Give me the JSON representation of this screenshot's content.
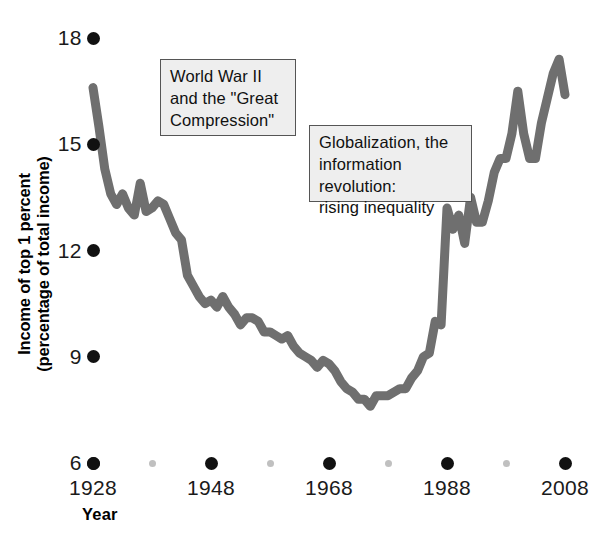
{
  "chart_data": {
    "type": "line",
    "title": "",
    "xlabel": "Year",
    "ylabel": "Income of top 1 percent (percentage of total income)",
    "ylabel_line1": "Income of top 1 percent",
    "ylabel_line2": "(percentage of total income)",
    "xlim": [
      1928,
      2008
    ],
    "ylim": [
      6,
      18
    ],
    "grid": false,
    "legend": "none",
    "series_color": "#6f6f6f",
    "y_ticks": [
      6,
      9,
      12,
      15,
      18
    ],
    "y_tick_labels": [
      "6",
      "9",
      "12",
      "15",
      "18"
    ],
    "x_ticks_major": [
      1928,
      1948,
      1968,
      1988,
      2008
    ],
    "x_tick_labels": [
      "1928",
      "1948",
      "1968",
      "1988",
      "2008"
    ],
    "x_ticks_minor": [
      1938,
      1958,
      1978,
      1998
    ],
    "annotations": [
      {
        "name": "ww2-great-compression",
        "text": "World War II\nand the \"Great\nCompression\"",
        "x": 160,
        "y": 59,
        "w": 136,
        "h": 77
      },
      {
        "name": "globalization-rising-inequality",
        "text": "Globalization, the\ninformation revolution:\nrising inequality",
        "x": 309,
        "y": 125,
        "w": 163,
        "h": 77
      }
    ],
    "x": [
      1928,
      1929,
      1930,
      1931,
      1932,
      1933,
      1934,
      1935,
      1936,
      1937,
      1938,
      1939,
      1940,
      1941,
      1942,
      1943,
      1944,
      1945,
      1946,
      1947,
      1948,
      1949,
      1950,
      1951,
      1952,
      1953,
      1954,
      1955,
      1956,
      1957,
      1958,
      1959,
      1960,
      1961,
      1962,
      1963,
      1964,
      1965,
      1966,
      1967,
      1968,
      1969,
      1970,
      1971,
      1972,
      1973,
      1974,
      1975,
      1976,
      1977,
      1978,
      1979,
      1980,
      1981,
      1982,
      1983,
      1984,
      1985,
      1986,
      1987,
      1988,
      1989,
      1990,
      1991,
      1992,
      1993,
      1994,
      1995,
      1996,
      1997,
      1998,
      1999,
      2000,
      2001,
      2002,
      2003,
      2004,
      2005,
      2006,
      2007,
      2008
    ],
    "values": [
      16.6,
      15.5,
      14.3,
      13.6,
      13.3,
      13.6,
      13.2,
      13.0,
      13.9,
      13.1,
      13.2,
      13.4,
      13.3,
      12.9,
      12.5,
      12.3,
      11.3,
      11.0,
      10.7,
      10.5,
      10.6,
      10.4,
      10.7,
      10.4,
      10.2,
      9.9,
      10.1,
      10.1,
      10.0,
      9.7,
      9.7,
      9.6,
      9.5,
      9.6,
      9.3,
      9.1,
      9.0,
      8.9,
      8.7,
      8.9,
      8.8,
      8.6,
      8.3,
      8.1,
      8.0,
      7.8,
      7.8,
      7.6,
      7.9,
      7.9,
      7.9,
      8.0,
      8.1,
      8.1,
      8.4,
      8.6,
      9.0,
      9.1,
      10.0,
      9.9,
      13.2,
      12.6,
      13.0,
      12.2,
      13.5,
      12.8,
      12.8,
      13.4,
      14.2,
      14.6,
      14.6,
      15.3,
      16.5,
      15.3,
      14.6,
      14.6,
      15.6,
      16.3,
      17.0,
      17.4,
      16.4
    ]
  },
  "axis": {
    "y_title_l1": "Income of top 1 percent",
    "y_title_l2": "(percentage of total income)",
    "x_title": "Year"
  }
}
